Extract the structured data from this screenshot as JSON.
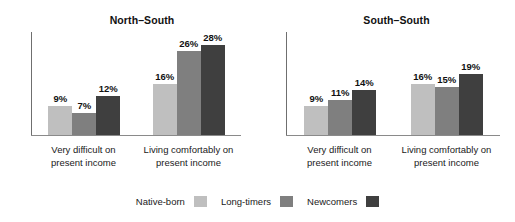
{
  "chart_data": {
    "type": "bar",
    "title": "",
    "xlabel": "",
    "ylabel": "",
    "ylim": [
      0,
      32
    ],
    "grid": false,
    "legend_position": "bottom",
    "series_names": [
      "Native-born",
      "Long-timers",
      "Newcomers"
    ],
    "series_colors": [
      "#bfbfbf",
      "#7f7f7f",
      "#3f3f3f"
    ],
    "categories": [
      "Very difficult on present income",
      "Living comfortably on present income"
    ],
    "panels": [
      {
        "title": "North–South",
        "categories": [
          {
            "line1": "Very difficult on",
            "line2": "present income"
          },
          {
            "line1": "Living comfortably on",
            "line2": "present income"
          }
        ],
        "series": [
          {
            "name": "Native-born",
            "values": [
              9,
              16
            ],
            "labels": [
              "9%",
              "16%"
            ]
          },
          {
            "name": "Long-timers",
            "values": [
              7,
              26
            ],
            "labels": [
              "7%",
              "26%"
            ]
          },
          {
            "name": "Newcomers",
            "values": [
              12,
              28
            ],
            "labels": [
              "12%",
              "28%"
            ]
          }
        ]
      },
      {
        "title": "South–South",
        "categories": [
          {
            "line1": "Very difficult on",
            "line2": "present income"
          },
          {
            "line1": "Living comfortably on",
            "line2": "present income"
          }
        ],
        "series": [
          {
            "name": "Native-born",
            "values": [
              9,
              16
            ],
            "labels": [
              "9%",
              "16%"
            ]
          },
          {
            "name": "Long-timers",
            "values": [
              11,
              15
            ],
            "labels": [
              "11%",
              "15%"
            ]
          },
          {
            "name": "Newcomers",
            "values": [
              14,
              19
            ],
            "labels": [
              "14%",
              "19%"
            ]
          }
        ]
      }
    ],
    "legend": [
      {
        "label": "Native-born",
        "color": "#bfbfbf"
      },
      {
        "label": "Long-timers",
        "color": "#7f7f7f"
      },
      {
        "label": "Newcomers",
        "color": "#3f3f3f"
      }
    ]
  }
}
